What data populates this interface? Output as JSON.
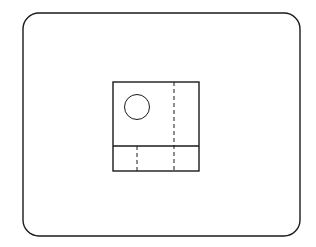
{
  "diagram": {
    "type": "orthographic-drawing",
    "background": "#ffffff",
    "stroke_color": "#1a1a1a",
    "frame": {
      "x": 23,
      "y": 13,
      "width": 277,
      "height": 223,
      "radius": 16,
      "stroke_width": 1.4
    },
    "view": {
      "x": 113,
      "y": 82,
      "width": 86,
      "height": 89,
      "stroke_width": 1.4
    },
    "divider": {
      "x1": 113,
      "y1": 146,
      "x2": 199,
      "y2": 146,
      "stroke_width": 1.4
    },
    "circle": {
      "cx": 137,
      "cy": 107,
      "r": 12.5,
      "stroke_width": 1
    },
    "hidden_lines": [
      {
        "x1": 174,
        "y1": 82,
        "x2": 174,
        "y2": 171
      },
      {
        "x1": 137,
        "y1": 146,
        "x2": 137,
        "y2": 171
      }
    ],
    "dash_pattern": "4,3"
  }
}
